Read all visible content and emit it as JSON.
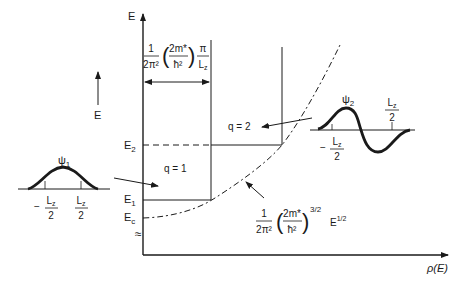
{
  "axes": {
    "y_label": "E",
    "x_label": "ρ(E)",
    "energy_arrow_label": "E",
    "break_symbol": "≈"
  },
  "levels": {
    "E2": {
      "label": "E",
      "sub": "2"
    },
    "E1": {
      "label": "E",
      "sub": "1"
    },
    "Ec": {
      "label": "E",
      "sub": "c"
    }
  },
  "subbands": {
    "q1": "q = 1",
    "q2": "q = 2"
  },
  "step_formula": {
    "num": "1",
    "den": "2π²",
    "inner_num": "2m*",
    "inner_den": "ħ²",
    "pi": "π",
    "Lz": "L",
    "Lz_sub": "z"
  },
  "bulk_formula": {
    "num": "1",
    "den": "2π²",
    "inner_num": "2m*",
    "inner_den": "ħ²",
    "exp": "3/2",
    "E": "E",
    "E_exp": "1/2"
  },
  "psi1": {
    "label": "ψ",
    "sub": "1",
    "left_tick": "−",
    "L": "L",
    "L_sub": "z",
    "two": "2"
  },
  "psi2": {
    "label": "ψ",
    "sub": "2",
    "left_tick": "−",
    "L": "L",
    "L_sub": "z",
    "two": "2"
  }
}
